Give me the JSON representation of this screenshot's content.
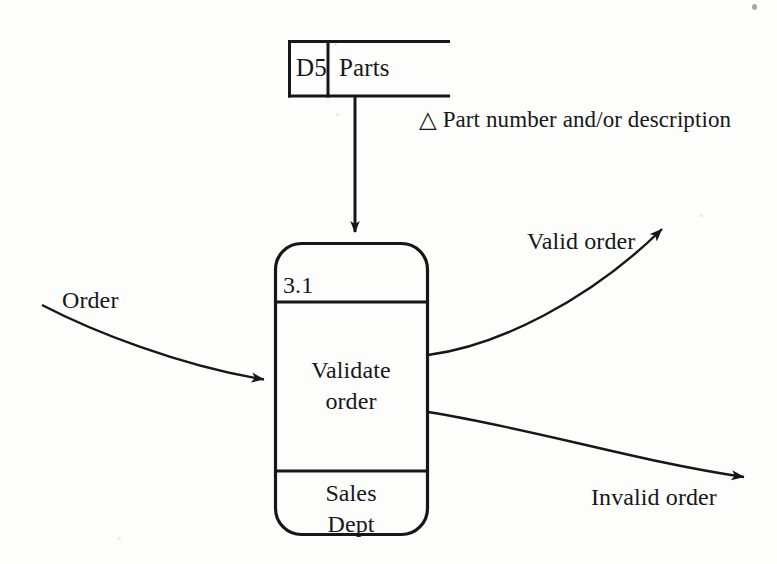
{
  "diagram": {
    "type": "data-flow-diagram",
    "background_color": "#fdfdfc",
    "ink_color": "#17171b",
    "data_store": {
      "id": "D5",
      "name": "Parts",
      "outflow_label": "△ Part number and/or description",
      "outflow_marker": "triangle-outline"
    },
    "process": {
      "id": "3.1",
      "name": "Validate\norder",
      "actor": "Sales\nDept"
    },
    "flows": {
      "input": "Order",
      "output_valid": "Valid order",
      "output_invalid": "Invalid order"
    }
  }
}
